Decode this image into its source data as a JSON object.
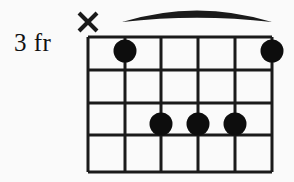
{
  "diagram": {
    "kind": "guitar-chord-diagram",
    "fret_label": "3 fr",
    "base_fret": 3,
    "string_count": 6,
    "fret_count": 4,
    "colors": {
      "background": "#fafafa",
      "line": "#1a1a1a",
      "dot": "#0d0d0d",
      "text": "#111111"
    },
    "geometry": {
      "grid_left": 88,
      "grid_right": 272,
      "string_spacing": 36.8,
      "fret_lines_y": [
        37,
        70,
        103,
        135,
        172
      ],
      "dot_radius": 11.5,
      "line_width": 3
    },
    "barre": {
      "present": true,
      "from_string": 2,
      "to_string": 6,
      "x_start": 122,
      "x_end": 272,
      "apex_y": 7,
      "end_y": 22,
      "thickness": 7
    },
    "markers": [
      {
        "name": "muted-string-1",
        "type": "mute",
        "symbol": "X",
        "string": 1,
        "x": 88,
        "y": 22
      }
    ],
    "dots": [
      {
        "name": "finger-dot-string-2-fret-1",
        "string": 2,
        "fret": 1,
        "cx": 125,
        "cy": 51
      },
      {
        "name": "finger-dot-string-6-fret-1",
        "string": 6,
        "fret": 1,
        "cx": 272,
        "cy": 51
      },
      {
        "name": "finger-dot-string-3-fret-3",
        "string": 3,
        "fret": 3,
        "cx": 161,
        "cy": 124
      },
      {
        "name": "finger-dot-string-4-fret-3",
        "string": 4,
        "fret": 3,
        "cx": 198,
        "cy": 124
      },
      {
        "name": "finger-dot-string-5-fret-3",
        "string": 5,
        "fret": 3,
        "cx": 235,
        "cy": 124
      }
    ],
    "strings_x": [
      88,
      125,
      161,
      198,
      235,
      272
    ]
  }
}
